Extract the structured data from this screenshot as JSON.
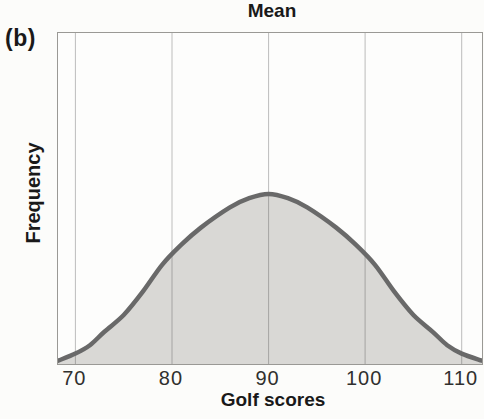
{
  "panel_label": "(b)",
  "colors": {
    "page_background": "#fcfcfa",
    "plot_background": "#fdfdfc",
    "plot_border": "#9a9995",
    "gridline": "rgba(70,70,70,0.35)",
    "curve_stroke": "#696969",
    "curve_fill": "#d9d8d5",
    "label_text": "#191919",
    "tick_text": "#30302e"
  },
  "chart_data": {
    "type": "area",
    "title": "",
    "annotation": "Mean",
    "xlabel": "Golf scores",
    "ylabel": "Frequency",
    "x_ticks": [
      70,
      80,
      90,
      100,
      110
    ],
    "x_range": [
      68.2,
      112.1
    ],
    "mean": 90,
    "grid": "vertical gridlines at each x tick",
    "legend": "none",
    "curve_points": [
      {
        "x": 68.2,
        "h": 0.008
      },
      {
        "x": 70,
        "h": 0.05
      },
      {
        "x": 71.5,
        "h": 0.1
      },
      {
        "x": 73,
        "h": 0.18
      },
      {
        "x": 75,
        "h": 0.28
      },
      {
        "x": 77,
        "h": 0.42
      },
      {
        "x": 79,
        "h": 0.58
      },
      {
        "x": 81,
        "h": 0.7
      },
      {
        "x": 83,
        "h": 0.8
      },
      {
        "x": 86,
        "h": 0.92
      },
      {
        "x": 88,
        "h": 0.975
      },
      {
        "x": 90,
        "h": 1.0
      },
      {
        "x": 92,
        "h": 0.975
      },
      {
        "x": 94,
        "h": 0.92
      },
      {
        "x": 97,
        "h": 0.8
      },
      {
        "x": 99,
        "h": 0.7
      },
      {
        "x": 101,
        "h": 0.58
      },
      {
        "x": 103,
        "h": 0.42
      },
      {
        "x": 105,
        "h": 0.28
      },
      {
        "x": 107,
        "h": 0.18
      },
      {
        "x": 108.5,
        "h": 0.1
      },
      {
        "x": 110,
        "h": 0.05
      },
      {
        "x": 112.1,
        "h": 0.008
      }
    ]
  }
}
